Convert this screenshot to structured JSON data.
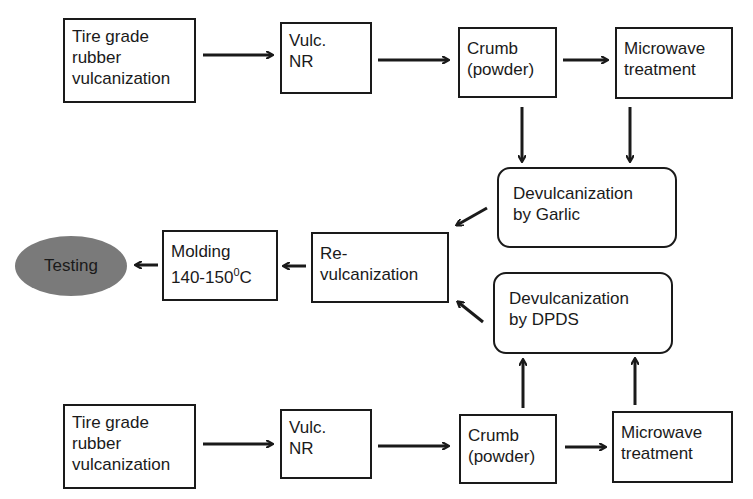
{
  "diagram": {
    "type": "flowchart",
    "nodes": {
      "top_tire": "Tire grade\nrubber\nvulcanization",
      "top_vulc": "Vulc.\nNR",
      "top_crumb": "Crumb\n(powder)",
      "top_microwave": "Microwave\ntreatment",
      "garlic": "Devulcanization\nby Garlic",
      "revulc": "Re-\nvulcanization",
      "molding_line1": "Molding",
      "molding_temp": "140-150",
      "molding_sup": "0",
      "molding_unit": "C",
      "testing": "Testing",
      "dpds": "Devulcanization\nby DPDS",
      "bottom_tire": "Tire grade\nrubber\nvulcanization",
      "bottom_vulc": "Vulc.\nNR",
      "bottom_crumb": "Crumb\n(powder)",
      "bottom_microwave": "Microwave\ntreatment"
    },
    "edges": [
      [
        "top_tire",
        "top_vulc"
      ],
      [
        "top_vulc",
        "top_crumb"
      ],
      [
        "top_crumb",
        "top_microwave"
      ],
      [
        "top_crumb",
        "garlic"
      ],
      [
        "top_microwave",
        "garlic"
      ],
      [
        "garlic",
        "revulc"
      ],
      [
        "dpds",
        "revulc"
      ],
      [
        "revulc",
        "molding"
      ],
      [
        "molding",
        "testing"
      ],
      [
        "bottom_tire",
        "bottom_vulc"
      ],
      [
        "bottom_vulc",
        "bottom_crumb"
      ],
      [
        "bottom_crumb",
        "bottom_microwave"
      ],
      [
        "bottom_crumb",
        "dpds"
      ],
      [
        "bottom_microwave",
        "dpds"
      ]
    ],
    "colors": {
      "stroke": "#1a1a1a",
      "testing_fill": "#7a7a7a",
      "background": "#ffffff"
    }
  }
}
